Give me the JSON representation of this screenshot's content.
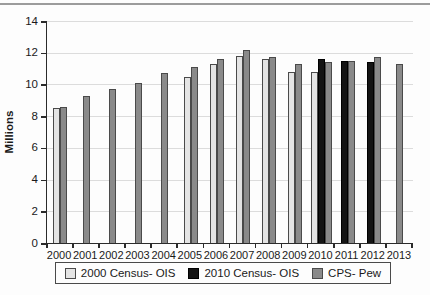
{
  "figure": {
    "top_rule_color": "#9c9c9c",
    "background_color": "#fdfdfd",
    "axis_color": "#2b2b2b",
    "gridline_color": "#dcdcdc",
    "text_color": "#1a1a1a"
  },
  "chart_data": {
    "type": "bar",
    "title": "",
    "xlabel": "",
    "ylabel": "Millions",
    "ylim": [
      0,
      14
    ],
    "yticks": [
      0,
      2,
      4,
      6,
      8,
      10,
      12,
      14
    ],
    "grid": true,
    "legend_position": "bottom",
    "categories": [
      "2000",
      "2001",
      "2002",
      "2003",
      "2004",
      "2005",
      "2006",
      "2007",
      "2008",
      "2009",
      "2010",
      "2011",
      "2012",
      "2013"
    ],
    "series": [
      {
        "name": "2000 Census- OIS",
        "color": "#e4e4e4",
        "border_color": "#4a4a4a",
        "values": [
          8.5,
          null,
          null,
          null,
          null,
          10.5,
          11.3,
          11.8,
          11.6,
          10.8,
          10.8,
          null,
          null,
          null
        ]
      },
      {
        "name": "2010 Census- OIS",
        "color": "#141414",
        "border_color": "#000000",
        "values": [
          null,
          null,
          null,
          null,
          null,
          null,
          null,
          null,
          null,
          null,
          11.6,
          11.5,
          11.4,
          null
        ]
      },
      {
        "name": "CPS- Pew",
        "color": "#8a8a8a",
        "border_color": "#4a4a4a",
        "values": [
          8.6,
          9.3,
          9.7,
          10.1,
          10.7,
          11.1,
          11.6,
          12.2,
          11.7,
          11.3,
          11.4,
          11.5,
          11.7,
          11.3
        ]
      }
    ]
  }
}
